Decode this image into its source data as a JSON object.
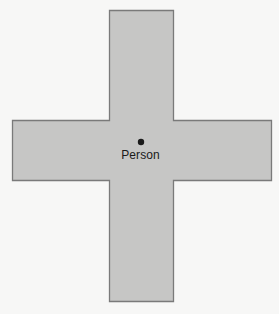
{
  "diagram": {
    "shape": "plus-cross",
    "fill_color": "#c6c6c5",
    "stroke_color": "#7a7a7a",
    "background_color": "#f7f7f6",
    "vertical_bar": {
      "x": 109,
      "y": 10,
      "width": 65,
      "height": 292
    },
    "horizontal_bar": {
      "x": 12,
      "y": 120,
      "width": 260,
      "height": 61
    },
    "center_point": {
      "x": 141,
      "y": 142,
      "radius": 3.2,
      "color": "#1a1a1a"
    },
    "label": "Person"
  }
}
